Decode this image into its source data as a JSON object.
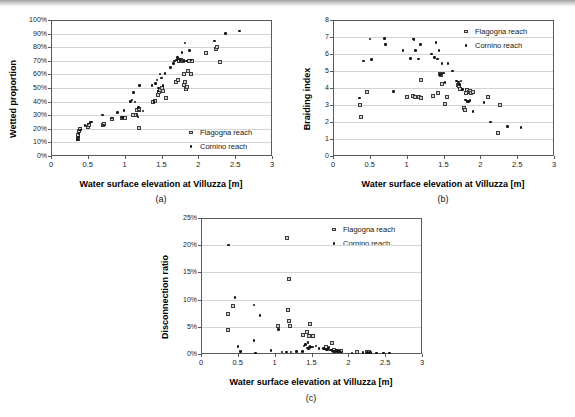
{
  "figure": {
    "shared_xlabel": "Water surface elevation at Villuzza [m]",
    "legend": {
      "flagogna_label": "Flagogna reach",
      "cornino_label": "Cornino reach",
      "flagogna_marker": "open-square-marker",
      "cornino_marker": "filled-dot-marker"
    },
    "captions": {
      "a": "(a)",
      "b": "(b)",
      "c": "(c)"
    },
    "colors": {
      "flagogna_fill": "#d2d2d2",
      "flagogna_stroke": "#3c3c3c",
      "cornino_fill": "#141414",
      "axis": "#5a5a5a",
      "grid": "#d3d3d3",
      "background": "#ffffff"
    }
  },
  "chart_data": [
    {
      "id": "a",
      "type": "scatter",
      "title": "",
      "caption": "(a)",
      "xlabel": "Water surface elevation at Villuzza [m]",
      "ylabel": "Wetted proportion",
      "xlim": [
        0,
        3
      ],
      "ylim": [
        0,
        1
      ],
      "xticks": [
        0,
        0.5,
        1,
        1.5,
        2,
        2.5,
        3
      ],
      "xticklabels": [
        "0",
        "0.5",
        "1",
        "1.5",
        "2",
        "2.5",
        "3"
      ],
      "yticks": [
        0,
        0.1,
        0.2,
        0.3,
        0.4,
        0.5,
        0.6,
        0.7,
        0.8,
        0.9,
        1.0
      ],
      "yticklabels": [
        "0%",
        "10%",
        "20%",
        "30%",
        "40%",
        "50%",
        "60%",
        "70%",
        "80%",
        "90%",
        "100%"
      ],
      "grid": "horizontal",
      "legend_position": "bottom-right",
      "series": [
        {
          "name": "Flagogna reach",
          "marker": "open-square-marker",
          "points": [
            [
              0.37,
              0.125
            ],
            [
              0.37,
              0.155
            ],
            [
              0.38,
              0.185
            ],
            [
              0.39,
              0.195
            ],
            [
              0.5,
              0.215
            ],
            [
              0.52,
              0.225
            ],
            [
              0.7,
              0.225
            ],
            [
              0.72,
              0.235
            ],
            [
              0.83,
              0.275
            ],
            [
              0.96,
              0.28
            ],
            [
              1.0,
              0.278
            ],
            [
              1.11,
              0.298
            ],
            [
              1.16,
              0.3
            ],
            [
              1.17,
              0.335
            ],
            [
              1.2,
              0.335
            ],
            [
              1.2,
              0.345
            ],
            [
              1.2,
              0.205
            ],
            [
              1.38,
              0.398
            ],
            [
              1.41,
              0.402
            ],
            [
              1.45,
              0.452
            ],
            [
              1.47,
              0.468
            ],
            [
              1.48,
              0.482
            ],
            [
              1.5,
              0.5
            ],
            [
              1.52,
              0.478
            ],
            [
              1.56,
              0.425
            ],
            [
              1.7,
              0.545
            ],
            [
              1.72,
              0.56
            ],
            [
              1.74,
              0.7
            ],
            [
              1.76,
              0.705
            ],
            [
              1.78,
              0.695
            ],
            [
              1.79,
              0.698
            ],
            [
              1.8,
              0.6
            ],
            [
              1.81,
              0.52
            ],
            [
              1.82,
              0.545
            ],
            [
              1.83,
              0.49
            ],
            [
              1.84,
              0.505
            ],
            [
              1.86,
              0.625
            ],
            [
              1.88,
              0.7
            ],
            [
              1.9,
              0.6
            ],
            [
              1.92,
              0.7
            ],
            [
              2.11,
              0.76
            ],
            [
              2.24,
              0.79
            ],
            [
              2.25,
              0.805
            ],
            [
              2.29,
              0.69
            ]
          ]
        },
        {
          "name": "Cornino reach",
          "marker": "filled-dot-marker",
          "points": [
            [
              0.36,
              0.12
            ],
            [
              0.37,
              0.14
            ],
            [
              0.38,
              0.165
            ],
            [
              0.4,
              0.19
            ],
            [
              0.46,
              0.225
            ],
            [
              0.5,
              0.235
            ],
            [
              0.53,
              0.248
            ],
            [
              0.55,
              0.25
            ],
            [
              0.7,
              0.3
            ],
            [
              0.72,
              0.228
            ],
            [
              0.83,
              0.278
            ],
            [
              0.9,
              0.322
            ],
            [
              0.97,
              0.285
            ],
            [
              0.99,
              0.335
            ],
            [
              1.08,
              0.4
            ],
            [
              1.1,
              0.412
            ],
            [
              1.12,
              0.468
            ],
            [
              1.14,
              0.398
            ],
            [
              1.17,
              0.3
            ],
            [
              1.18,
              0.288
            ],
            [
              1.19,
              0.355
            ],
            [
              1.2,
              0.518
            ],
            [
              1.25,
              0.332
            ],
            [
              1.37,
              0.518
            ],
            [
              1.4,
              0.4
            ],
            [
              1.42,
              0.535
            ],
            [
              1.44,
              0.56
            ],
            [
              1.45,
              0.478
            ],
            [
              1.46,
              0.5
            ],
            [
              1.48,
              0.602
            ],
            [
              1.5,
              0.575
            ],
            [
              1.52,
              0.52
            ],
            [
              1.55,
              0.608
            ],
            [
              1.62,
              0.65
            ],
            [
              1.66,
              0.678
            ],
            [
              1.68,
              0.7
            ],
            [
              1.7,
              0.705
            ],
            [
              1.72,
              0.725
            ],
            [
              1.74,
              0.712
            ],
            [
              1.75,
              0.708
            ],
            [
              1.78,
              0.762
            ],
            [
              1.8,
              0.7
            ],
            [
              1.82,
              0.83
            ],
            [
              1.84,
              0.7
            ],
            [
              1.88,
              0.775
            ],
            [
              1.9,
              0.705
            ],
            [
              2.22,
              0.845
            ],
            [
              2.37,
              0.9
            ],
            [
              2.56,
              0.918
            ]
          ]
        }
      ]
    },
    {
      "id": "b",
      "type": "scatter",
      "title": "",
      "caption": "(b)",
      "xlabel": "Water surface elevation at Villuzza [m]",
      "ylabel": "Braiding index",
      "xlim": [
        0,
        3
      ],
      "ylim": [
        0,
        8
      ],
      "xticks": [
        0,
        0.5,
        1,
        1.5,
        2,
        2.5,
        3
      ],
      "xticklabels": [
        "0",
        "0.5",
        "1",
        "1.5",
        "2",
        "2.5",
        "3"
      ],
      "yticks": [
        0,
        1,
        2,
        3,
        4,
        5,
        6,
        7,
        8
      ],
      "yticklabels": [
        "0",
        "1",
        "2",
        "3",
        "4",
        "5",
        "6",
        "7",
        "8"
      ],
      "grid": "horizontal",
      "legend_position": "top-right",
      "series": [
        {
          "name": "Flagogna reach",
          "marker": "open-square-marker",
          "points": [
            [
              0.37,
              3.02
            ],
            [
              0.38,
              2.31
            ],
            [
              0.46,
              3.76
            ],
            [
              1.0,
              3.45
            ],
            [
              1.09,
              3.52
            ],
            [
              1.11,
              3.5
            ],
            [
              1.17,
              3.48
            ],
            [
              1.19,
              3.44
            ],
            [
              1.2,
              4.47
            ],
            [
              1.36,
              3.55
            ],
            [
              1.42,
              3.72
            ],
            [
              1.45,
              4.8
            ],
            [
              1.46,
              4.74
            ],
            [
              1.48,
              4.26
            ],
            [
              1.52,
              3.05
            ],
            [
              1.55,
              3.48
            ],
            [
              1.7,
              4.18
            ],
            [
              1.71,
              4.1
            ],
            [
              1.73,
              3.95
            ],
            [
              1.78,
              2.8
            ],
            [
              1.79,
              2.68
            ],
            [
              1.8,
              3.7
            ],
            [
              1.82,
              3.88
            ],
            [
              1.84,
              3.78
            ],
            [
              1.86,
              3.8
            ],
            [
              1.88,
              3.72
            ],
            [
              1.9,
              3.75
            ],
            [
              2.1,
              3.5
            ],
            [
              2.24,
              1.33
            ],
            [
              2.27,
              3.02
            ]
          ]
        },
        {
          "name": "Cornino reach",
          "marker": "filled-dot-marker",
          "points": [
            [
              0.36,
              3.4
            ],
            [
              0.41,
              5.6
            ],
            [
              0.5,
              6.88
            ],
            [
              0.52,
              5.66
            ],
            [
              0.7,
              6.9
            ],
            [
              0.71,
              6.6
            ],
            [
              0.71,
              6.52
            ],
            [
              0.82,
              3.78
            ],
            [
              0.95,
              6.22
            ],
            [
              1.05,
              5.75
            ],
            [
              1.09,
              6.88
            ],
            [
              1.1,
              6.84
            ],
            [
              1.12,
              6.22
            ],
            [
              1.16,
              5.7
            ],
            [
              1.19,
              6.55
            ],
            [
              1.34,
              6.0
            ],
            [
              1.38,
              5.78
            ],
            [
              1.4,
              6.66
            ],
            [
              1.42,
              5.7
            ],
            [
              1.44,
              6.22
            ],
            [
              1.46,
              4.78
            ],
            [
              1.48,
              5.45
            ],
            [
              1.5,
              4.88
            ],
            [
              1.52,
              4.32
            ],
            [
              1.56,
              5.45
            ],
            [
              1.62,
              5.0
            ],
            [
              1.68,
              4.42
            ],
            [
              1.7,
              4.35
            ],
            [
              1.72,
              4.2
            ],
            [
              1.74,
              4.4
            ],
            [
              1.76,
              3.9
            ],
            [
              1.8,
              3.3
            ],
            [
              1.82,
              3.22
            ],
            [
              1.84,
              3.2
            ],
            [
              1.86,
              3.28
            ],
            [
              1.9,
              2.62
            ],
            [
              2.05,
              3.15
            ],
            [
              2.14,
              2.0
            ],
            [
              2.37,
              1.72
            ],
            [
              2.55,
              1.66
            ]
          ]
        }
      ]
    },
    {
      "id": "c",
      "type": "scatter",
      "title": "",
      "caption": "(c)",
      "xlabel": "Water surface elevation at Villuzza [m]",
      "ylabel": "Disconnection ratio",
      "xlim": [
        0,
        3
      ],
      "ylim": [
        0,
        0.25
      ],
      "xticks": [
        0,
        0.5,
        1,
        1.5,
        2,
        2.5,
        3
      ],
      "xticklabels": [
        "0",
        "0.5",
        "1",
        "1.5",
        "2",
        "2.5",
        "3"
      ],
      "yticks": [
        0,
        0.05,
        0.1,
        0.15,
        0.2,
        0.25
      ],
      "yticklabels": [
        "0%",
        "5%",
        "10%",
        "15%",
        "20%",
        "25%"
      ],
      "grid": "horizontal",
      "legend_position": "top-right",
      "series": [
        {
          "name": "Flagogna reach",
          "marker": "open-square-marker",
          "points": [
            [
              0.37,
              0.073
            ],
            [
              0.37,
              0.045
            ],
            [
              0.44,
              0.088
            ],
            [
              1.05,
              0.052
            ],
            [
              1.17,
              0.214
            ],
            [
              1.18,
              0.081
            ],
            [
              1.19,
              0.137
            ],
            [
              1.2,
              0.06
            ],
            [
              1.21,
              0.052
            ],
            [
              1.38,
              0.035
            ],
            [
              1.44,
              0.04
            ],
            [
              1.46,
              0.033
            ],
            [
              1.48,
              0.056
            ],
            [
              1.52,
              0.034
            ],
            [
              1.7,
              0.013
            ],
            [
              1.78,
              0.02
            ],
            [
              1.8,
              0.008
            ],
            [
              1.84,
              0.006
            ],
            [
              1.86,
              0.006
            ],
            [
              1.88,
              0.005
            ],
            [
              1.9,
              0.006
            ],
            [
              2.12,
              0.003
            ],
            [
              2.25,
              0.003
            ],
            [
              2.28,
              0.003
            ]
          ]
        },
        {
          "name": "Cornino reach",
          "marker": "filled-dot-marker",
          "points": [
            [
              0.37,
              0.2
            ],
            [
              0.46,
              0.104
            ],
            [
              0.5,
              0.014
            ],
            [
              0.54,
              0.005
            ],
            [
              0.72,
              0.09
            ],
            [
              0.72,
              0.025
            ],
            [
              0.74,
              0.002
            ],
            [
              0.8,
              0.071
            ],
            [
              0.95,
              0.006
            ],
            [
              1.05,
              0.045
            ],
            [
              1.1,
              0.004
            ],
            [
              1.16,
              0.004
            ],
            [
              1.22,
              0.004
            ],
            [
              1.3,
              0.005
            ],
            [
              1.38,
              0.005
            ],
            [
              1.4,
              0.015
            ],
            [
              1.42,
              0.018
            ],
            [
              1.44,
              0.011
            ],
            [
              1.45,
              0.021
            ],
            [
              1.46,
              0.01
            ],
            [
              1.47,
              0.012
            ],
            [
              1.48,
              0.014
            ],
            [
              1.5,
              0.013
            ],
            [
              1.52,
              0.013
            ],
            [
              1.56,
              0.015
            ],
            [
              1.6,
              0.01
            ],
            [
              1.66,
              0.01
            ],
            [
              1.68,
              0.009
            ],
            [
              1.7,
              0.008
            ],
            [
              1.72,
              0.008
            ],
            [
              1.74,
              0.012
            ],
            [
              1.76,
              0.007
            ],
            [
              1.78,
              0.006
            ],
            [
              1.8,
              0.005
            ],
            [
              1.82,
              0.005
            ],
            [
              1.84,
              0.006
            ],
            [
              1.86,
              0.005
            ],
            [
              1.88,
              0.005
            ],
            [
              1.9,
              0.004
            ],
            [
              2.05,
              0.002
            ],
            [
              2.2,
              0.003
            ],
            [
              2.26,
              0.003
            ],
            [
              2.3,
              0.003
            ],
            [
              2.38,
              0.002
            ],
            [
              2.48,
              0.002
            ],
            [
              2.56,
              0.002
            ]
          ]
        }
      ]
    }
  ]
}
